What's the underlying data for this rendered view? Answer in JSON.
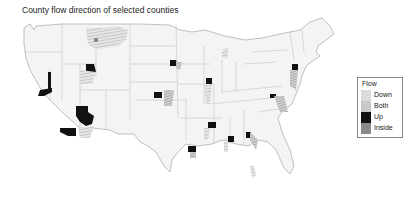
{
  "title": "County flow direction of selected counties",
  "legend": {
    "title": "Flow",
    "items": [
      {
        "label": "Down",
        "fill": "hatch-light",
        "color": "#c8c8c8"
      },
      {
        "label": "Both",
        "fill": "hatch-mid",
        "color": "#b0b0b0"
      },
      {
        "label": "Up",
        "fill": "solid",
        "color": "#111111"
      },
      {
        "label": "Inside",
        "fill": "solid",
        "color": "#8a8a8a"
      }
    ]
  },
  "map": {
    "region": "Contiguous United States",
    "boundaries": "county and state outlines",
    "base_color": "#f4f4f4",
    "border_color": "#bdbdbd"
  }
}
